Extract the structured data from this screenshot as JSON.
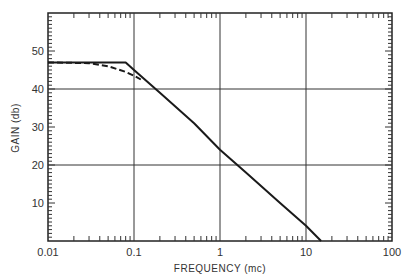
{
  "chart_data": {
    "type": "line",
    "title": "",
    "xlabel": "FREQUENCY (mc)",
    "ylabel": "GAIN (db)",
    "xscale": "log",
    "xlim": [
      0.01,
      100
    ],
    "ylim": [
      0,
      60
    ],
    "x_tick_labels": [
      "0.01",
      "0.1",
      "1",
      "10",
      "100"
    ],
    "x_ticks": [
      0.01,
      0.1,
      1,
      10,
      100
    ],
    "y_tick_labels": [
      "10",
      "20",
      "30",
      "40",
      "50"
    ],
    "y_ticks": [
      10,
      20,
      30,
      40,
      50
    ],
    "grid": {
      "x": [
        0.1,
        1,
        10
      ],
      "y": [
        20,
        40
      ]
    },
    "legend": null,
    "series": [
      {
        "name": "asymptotic approximation",
        "style": "solid",
        "x": [
          0.01,
          0.08,
          0.1,
          0.2,
          0.5,
          1,
          2,
          5,
          10,
          15
        ],
        "y": [
          47,
          47,
          45,
          39,
          31,
          24,
          18,
          10,
          4,
          0
        ]
      },
      {
        "name": "actual response",
        "style": "dashed",
        "x": [
          0.01,
          0.03,
          0.05,
          0.08,
          0.1,
          0.12
        ],
        "y": [
          47,
          46.8,
          46,
          44.5,
          43.5,
          42.5
        ]
      }
    ]
  },
  "plot": {
    "x_labels": [
      "0.01",
      "0.1",
      "1",
      "10",
      "100"
    ],
    "y_labels": [
      "10",
      "20",
      "30",
      "40",
      "50"
    ],
    "xlabel": "FREQUENCY (mc)",
    "ylabel": "GAIN (db)"
  },
  "colors": {
    "line": "#1a1a1a",
    "grid": "#2a2a2a",
    "background": "#ffffff"
  }
}
